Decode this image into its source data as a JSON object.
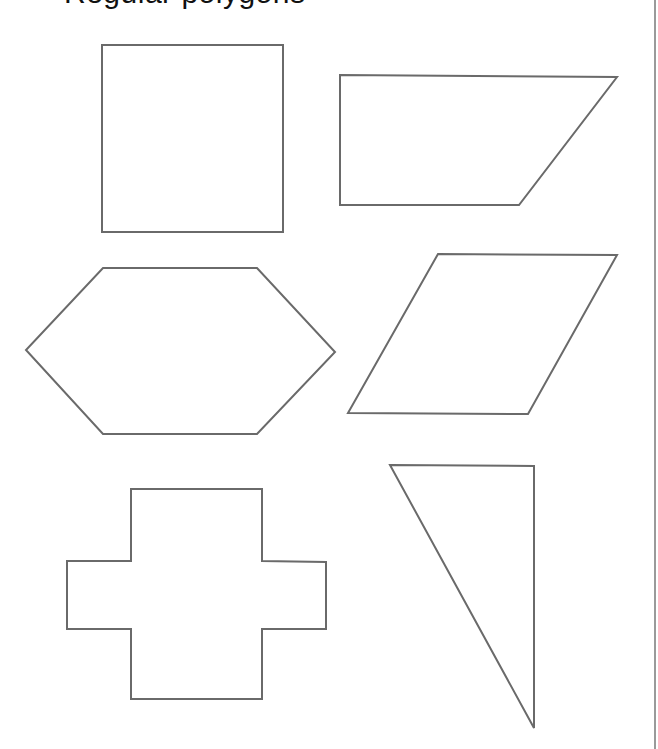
{
  "page": {
    "heading_fragment": "Regular polygons",
    "stroke_color": "#6a6a6a",
    "rule_color": "#9a9a9a"
  },
  "shapes": [
    {
      "name": "square",
      "points": "102,45 283,45 283,232 102,232"
    },
    {
      "name": "trapezoid",
      "points": "340,75 617,77 519,205 340,205"
    },
    {
      "name": "hexagon",
      "points": "103,268 257,268 335,352 257,434 103,434 26,350"
    },
    {
      "name": "rhombus",
      "points": "438,254 617,255 528,414 348,413"
    },
    {
      "name": "cross",
      "points": "131,489 262,489 262,561 326,562 326,629 262,629 262,699 131,699 131,629 67,629 67,561 131,561"
    },
    {
      "name": "right-triangle",
      "points": "390,465 534,466 534,728"
    }
  ]
}
